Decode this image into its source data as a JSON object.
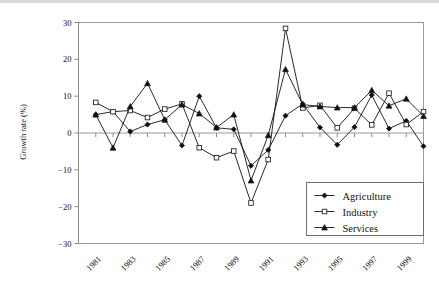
{
  "chart_data": {
    "type": "line",
    "title": "",
    "xlabel": "",
    "ylabel": "Growth rate (%)",
    "xlim": [
      1980,
      2000
    ],
    "ylim": [
      -30,
      30
    ],
    "yticks": [
      -30,
      -20,
      -10,
      0,
      10,
      20,
      30
    ],
    "ytick_labels": [
      "−30",
      "−20",
      "−10",
      "0",
      "10",
      "20",
      "30"
    ],
    "xticks": [
      1981,
      1983,
      1985,
      1987,
      1989,
      1991,
      1993,
      1995,
      1997,
      1999
    ],
    "xtick_labels": [
      "1981",
      "1983",
      "1985",
      "1987",
      "1989",
      "1991",
      "1993",
      "1995",
      "1997",
      "1999"
    ],
    "x": [
      1981,
      1982,
      1983,
      1984,
      1985,
      1986,
      1987,
      1988,
      1989,
      1990,
      1991,
      1992,
      1993,
      1994,
      1995,
      1996,
      1997,
      1998,
      1999,
      2000
    ],
    "grid": false,
    "legend_position": "lower right",
    "series": [
      {
        "name": "Agriculture",
        "marker": "filled-diamond",
        "color": "#111111",
        "values": [
          5.0,
          5.8,
          0.4,
          2.3,
          3.6,
          -3.4,
          10.0,
          1.4,
          1.0,
          -8.9,
          -4.6,
          4.7,
          7.9,
          1.5,
          -3.2,
          1.6,
          10.3,
          1.2,
          3.3,
          -3.6
        ]
      },
      {
        "name": "Industry",
        "marker": "open-square",
        "color": "#111111",
        "values": [
          8.3,
          5.8,
          6.1,
          4.2,
          6.5,
          7.9,
          -4.0,
          -6.7,
          -4.9,
          -19.0,
          -7.2,
          28.4,
          6.8,
          7.5,
          1.4,
          6.7,
          2.2,
          10.8,
          2.3,
          5.8
        ]
      },
      {
        "name": "Services",
        "marker": "filled-triangle",
        "color": "#111111",
        "values": [
          5.0,
          -4.0,
          7.2,
          13.5,
          3.6,
          7.7,
          5.3,
          1.5,
          5.0,
          -12.9,
          -0.6,
          17.3,
          7.7,
          7.2,
          6.9,
          6.9,
          11.6,
          7.4,
          9.3,
          4.6
        ]
      }
    ]
  },
  "legend": {
    "items": [
      {
        "label": "Agriculture",
        "marker": "filled-diamond"
      },
      {
        "label": "Industry",
        "marker": "open-square"
      },
      {
        "label": "Services",
        "marker": "filled-triangle"
      }
    ]
  }
}
